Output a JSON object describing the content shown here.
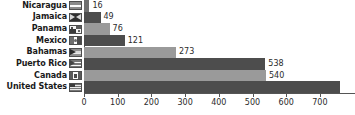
{
  "chart_data": {
    "type": "bar",
    "orientation": "horizontal",
    "title": "",
    "xlabel": "",
    "ylabel": "",
    "grid": false,
    "legend": false,
    "xlim": [
      0,
      760
    ],
    "xticks": [
      0,
      100,
      200,
      300,
      400,
      500,
      600,
      700
    ],
    "xtick_labels": [
      "0",
      "100",
      "200",
      "300",
      "400",
      "500",
      "600",
      "700"
    ],
    "categories": [
      "Nicaragua",
      "Jamaica",
      "Panama",
      "Mexico",
      "Bahamas",
      "Puerto Rico",
      "Canada",
      "United States"
    ],
    "values": [
      16,
      49,
      76,
      121,
      273,
      538,
      540,
      760
    ],
    "value_labels": [
      "16",
      "49",
      "76",
      "121",
      "273",
      "538",
      "540",
      ""
    ],
    "colors": [
      "#707070",
      "#4d4d4d",
      "#9a9a9a",
      "#4d4d4d",
      "#9a9a9a",
      "#4d4d4d",
      "#9a9a9a",
      "#4d4d4d"
    ],
    "icons": [
      "flag-nicaragua-icon",
      "flag-jamaica-icon",
      "flag-panama-icon",
      "flag-mexico-icon",
      "flag-bahamas-icon",
      "flag-puertorico-icon",
      "flag-canada-icon",
      "flag-us-icon"
    ],
    "axis_color": "#555555",
    "background": "#ffffff"
  }
}
